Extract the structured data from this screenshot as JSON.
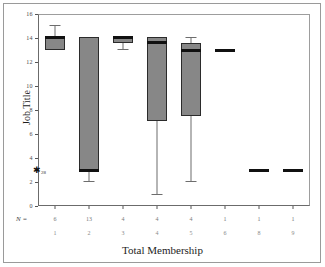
{
  "figure": {
    "ylabel": "Job Title",
    "xlabel": "Total Membership",
    "n_legend": "N =",
    "box_fill_color": "#878787",
    "box_edge_color": "#2b2b2b",
    "median_color": "#111111",
    "whisker_color": "#6d6d6d",
    "frame_color": "#9a9a9a"
  },
  "chart_data": {
    "type": "box",
    "title": "",
    "xlabel": "Total Membership",
    "ylabel": "Job Title",
    "ylim": [
      0,
      16
    ],
    "yticks": [
      0,
      2,
      4,
      6,
      8,
      10,
      12,
      14,
      16
    ],
    "ytick_labels": [
      "0",
      "2",
      "4",
      "6",
      "8",
      "10",
      "12",
      "14",
      "16"
    ],
    "grid": false,
    "legend": "none",
    "categories": [
      "1",
      "2",
      "3",
      "4",
      "5",
      "6",
      "8",
      "9"
    ],
    "counts": [
      "6",
      "13",
      "4",
      "4",
      "4",
      "1",
      "1",
      "1"
    ],
    "boxes": [
      {
        "category": "1",
        "n": 6,
        "whisker_low": 13.0,
        "q1": 13.0,
        "median": 14.1,
        "q3": 14.2,
        "whisker_high": 15.1,
        "single_value": null,
        "outliers": [
          {
            "value": 3.0,
            "label": "28"
          }
        ]
      },
      {
        "category": "2",
        "n": 13,
        "whisker_low": 2.1,
        "q1": 3.0,
        "median": 3.0,
        "q3": 14.1,
        "whisker_high": 14.1,
        "single_value": null,
        "outliers": []
      },
      {
        "category": "3",
        "n": 4,
        "whisker_low": 13.1,
        "q1": 13.6,
        "median": 14.1,
        "q3": 14.1,
        "whisker_high": 14.1,
        "single_value": null,
        "outliers": []
      },
      {
        "category": "4",
        "n": 4,
        "whisker_low": 1.0,
        "q1": 7.1,
        "median": 13.7,
        "q3": 14.1,
        "whisker_high": 14.1,
        "single_value": null,
        "outliers": []
      },
      {
        "category": "5",
        "n": 4,
        "whisker_low": 2.1,
        "q1": 7.5,
        "median": 13.0,
        "q3": 13.6,
        "whisker_high": 14.1,
        "single_value": null,
        "outliers": []
      },
      {
        "category": "6",
        "n": 1,
        "whisker_low": null,
        "q1": null,
        "median": 13.0,
        "q3": null,
        "whisker_high": null,
        "single_value": 13.0,
        "outliers": []
      },
      {
        "category": "8",
        "n": 1,
        "whisker_low": null,
        "q1": null,
        "median": 3.0,
        "q3": null,
        "whisker_high": null,
        "single_value": 3.0,
        "outliers": []
      },
      {
        "category": "9",
        "n": 1,
        "whisker_low": null,
        "q1": null,
        "median": 3.0,
        "q3": null,
        "whisker_high": null,
        "single_value": 3.0,
        "outliers": []
      }
    ]
  }
}
